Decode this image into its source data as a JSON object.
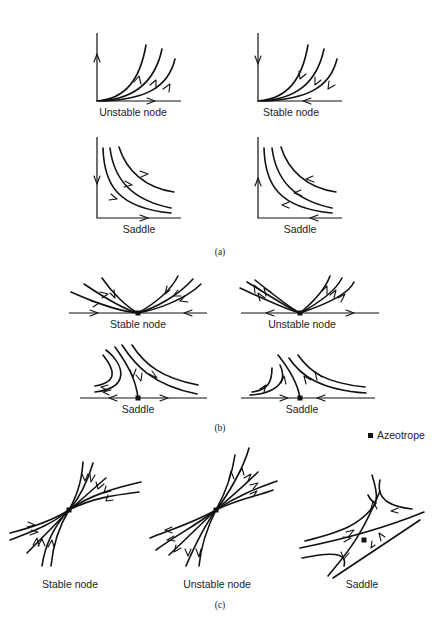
{
  "figure": {
    "part_a": {
      "caption": "(a)",
      "panels": [
        {
          "label": "Unstable node"
        },
        {
          "label": "Stable node"
        },
        {
          "label": "Saddle"
        },
        {
          "label": "Saddle"
        }
      ]
    },
    "part_b": {
      "caption": "(b)",
      "panels": [
        {
          "label": "Stable node"
        },
        {
          "label": "Unstable node"
        },
        {
          "label": "Saddle"
        },
        {
          "label": "Saddle"
        }
      ]
    },
    "part_c": {
      "caption": "(c)",
      "panels": [
        {
          "label": "Stable node"
        },
        {
          "label": "Unstable node"
        },
        {
          "label": "Saddle"
        }
      ]
    },
    "legend": {
      "marker": "filled-square",
      "label": "Azeotrope"
    },
    "colors": {
      "line": "#111111",
      "background": "#ffffff"
    }
  }
}
